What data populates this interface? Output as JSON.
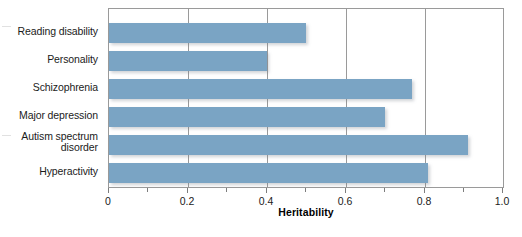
{
  "chart_data": {
    "type": "bar",
    "orientation": "horizontal",
    "title": "",
    "xlabel": "Heritability",
    "ylabel": "",
    "categories": [
      "Reading disability",
      "Personality",
      "Schizophrenia",
      "Major depression",
      "Autism spectrum disorder",
      "Hyperactivity"
    ],
    "values": [
      0.5,
      0.4,
      0.77,
      0.7,
      0.91,
      0.81
    ],
    "xlim": [
      0,
      1.0
    ],
    "xticks": [
      0,
      0.2,
      0.4,
      0.6,
      0.8,
      1.0
    ],
    "xticklabels": [
      "0",
      "0.2",
      "0.4",
      "0.6",
      "0.8",
      "1.0"
    ],
    "xminorticks": [
      0.1,
      0.3,
      0.5,
      0.7,
      0.9
    ],
    "gridlines": [
      0.2,
      0.4,
      0.6,
      0.8
    ],
    "grid": true,
    "legend": null,
    "bar_color": "#7AA4C4",
    "axis_color": "#9A9A9A",
    "series": [
      {
        "name": "Heritability",
        "points": [
          {
            "category": "Reading disability",
            "value": 0.5
          },
          {
            "category": "Personality",
            "value": 0.4
          },
          {
            "category": "Schizophrenia",
            "value": 0.77
          },
          {
            "category": "Major depression",
            "value": 0.7
          },
          {
            "category": "Autism spectrum disorder",
            "value": 0.91
          },
          {
            "category": "Hyperactivity",
            "value": 0.81
          }
        ]
      }
    ]
  },
  "labels": {
    "cat0_line1": "Reading disability",
    "cat1_line1": "Personality",
    "cat2_line1": "Schizophrenia",
    "cat3_line1": "Major depression",
    "cat4_line1": "Autism spectrum",
    "cat4_line2": "disorder",
    "cat5_line1": "Hyperactivity"
  },
  "axis": {
    "t0": "0",
    "t1": "0.2",
    "t2": "0.4",
    "t3": "0.6",
    "t4": "0.8",
    "t5": "1.0",
    "xlabel": "Heritability"
  }
}
